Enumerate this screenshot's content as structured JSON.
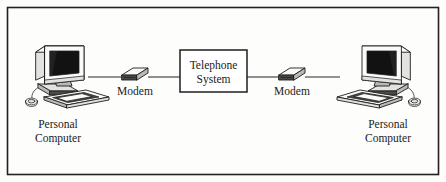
{
  "figure": {
    "frame": {
      "stroke_color": "#23211f"
    },
    "background_color": "#fdfdfc",
    "ink_color": "#1d1d1d"
  },
  "nodes": {
    "left_computer": {
      "label_line1": "Personal",
      "label_line2": "Computer",
      "icon": "desktop-computer-icon"
    },
    "left_modem": {
      "label": "Modem",
      "icon": "modem-box-icon"
    },
    "telephone_system": {
      "label_line1": "Telephone",
      "label_line2": "System",
      "shape": "rectangle"
    },
    "right_modem": {
      "label": "Modem",
      "icon": "modem-box-icon"
    },
    "right_computer": {
      "label_line1": "Personal",
      "label_line2": "Computer",
      "icon": "desktop-computer-icon"
    }
  },
  "connections": [
    {
      "from": "left_computer",
      "to": "left_modem",
      "style": "solid-line"
    },
    {
      "from": "left_modem",
      "to": "telephone_system",
      "style": "solid-line"
    },
    {
      "from": "telephone_system",
      "to": "right_modem",
      "style": "solid-line"
    },
    {
      "from": "right_modem",
      "to": "right_computer",
      "style": "solid-line"
    }
  ]
}
